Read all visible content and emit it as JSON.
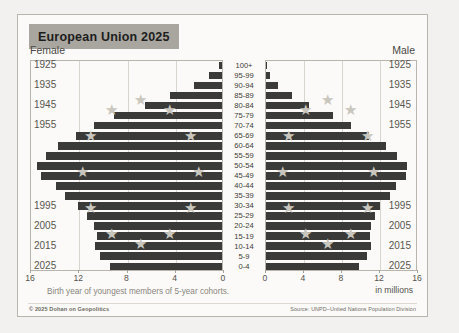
{
  "card": {
    "title": "European Union 2025",
    "female_label": "Female",
    "male_label": "Male",
    "axis_note": "Birth year of youngest members of 5-year cohorts.",
    "units_label": "in millions",
    "credit": "© 2025 Dohan on Geopolitics",
    "source": "Source: UNPD–United Nations Population Division"
  },
  "colors": {
    "bar": "#3a3a38",
    "star": "#c9c6bd",
    "title_band": "#a9a6a0",
    "card_bg": "#fbfaf8",
    "page_bg": "#f2f1ef",
    "grid": "#d8d5cf",
    "border": "#b9b5ad"
  },
  "year_labels_left": [
    {
      "year": "1925",
      "age_index": 0
    },
    {
      "year": "1935",
      "age_index": 2
    },
    {
      "year": "1945",
      "age_index": 4
    },
    {
      "year": "1955",
      "age_index": 6
    },
    {
      "year": "1995",
      "age_index": 14
    },
    {
      "year": "2005",
      "age_index": 16
    },
    {
      "year": "2015",
      "age_index": 18
    },
    {
      "year": "2025",
      "age_index": 20
    }
  ],
  "year_labels_right": [
    {
      "year": "1925",
      "age_index": 0
    },
    {
      "year": "1935",
      "age_index": 2
    },
    {
      "year": "1945",
      "age_index": 4
    },
    {
      "year": "1955",
      "age_index": 6
    },
    {
      "year": "1995",
      "age_index": 14
    },
    {
      "year": "2005",
      "age_index": 16
    },
    {
      "year": "2015",
      "age_index": 18
    },
    {
      "year": "2025",
      "age_index": 20
    }
  ],
  "chart_data": {
    "type": "bar",
    "subtype": "population-pyramid",
    "title": "European Union 2025",
    "xlabel": "in millions",
    "ylabel": "Age cohort",
    "grid": true,
    "legend": "none",
    "left_panel": {
      "name": "Female",
      "direction": "left",
      "xlim": [
        0,
        16
      ],
      "ticks": [
        16,
        12,
        8,
        4,
        0
      ]
    },
    "right_panel": {
      "name": "Male",
      "direction": "right",
      "xlim": [
        0,
        16
      ],
      "ticks": [
        0,
        4,
        8,
        12,
        16
      ]
    },
    "categories": [
      "100+",
      "95-99",
      "90-94",
      "85-89",
      "80-84",
      "75-79",
      "70-74",
      "65-69",
      "60-64",
      "55-59",
      "50-54",
      "45-49",
      "40-44",
      "35-39",
      "30-34",
      "25-29",
      "20-24",
      "15-19",
      "10-14",
      "5-9",
      "0-4"
    ],
    "series": [
      {
        "name": "Female",
        "values": [
          0.22,
          1.05,
          2.35,
          4.35,
          6.35,
          8.95,
          10.6,
          12.1,
          13.6,
          14.6,
          15.3,
          15.0,
          13.8,
          13.0,
          11.9,
          11.2,
          10.6,
          10.4,
          10.5,
          10.1,
          9.3
        ]
      },
      {
        "name": "Male",
        "values": [
          0.07,
          0.45,
          1.25,
          2.75,
          4.55,
          7.05,
          8.95,
          10.8,
          12.6,
          13.8,
          14.8,
          14.7,
          13.7,
          13.0,
          12.0,
          11.5,
          11.1,
          10.9,
          11.0,
          10.6,
          9.8
        ]
      }
    ]
  }
}
